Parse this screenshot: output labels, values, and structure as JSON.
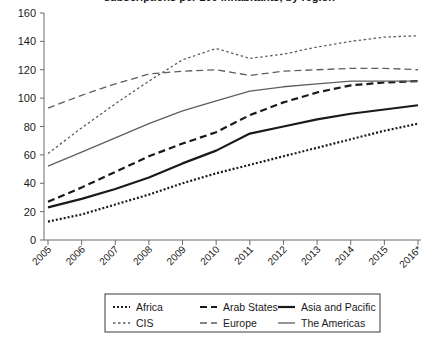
{
  "chart": {
    "title_partial": "subscriptions per 100 inhabitants, by region",
    "title_visible": false
  },
  "chart_data": {
    "type": "line",
    "title": "",
    "xlabel": "",
    "ylabel": "",
    "ylim": [
      0,
      160
    ],
    "ytick_values": [
      0,
      20,
      40,
      60,
      80,
      100,
      120,
      140,
      160
    ],
    "ytick_labels": [
      "0",
      "20",
      "40",
      "60",
      "80",
      "100",
      "120",
      "140",
      "160"
    ],
    "grid": false,
    "legend_position": "bottom",
    "legend_columns": 3,
    "x": [
      "2005",
      "2006",
      "2007",
      "2008",
      "2009",
      "2010",
      "2011",
      "2012",
      "2013",
      "2014",
      "2015",
      "2016*"
    ],
    "categories": [
      "2005",
      "2006",
      "2007",
      "2008",
      "2009",
      "2010",
      "2011",
      "2012",
      "2013",
      "2014",
      "2015",
      "2016*"
    ],
    "series": [
      {
        "name": "Africa",
        "style": "dotted",
        "color": "#1a1a1a",
        "width": 2.2,
        "dash": "2,2",
        "values": [
          13,
          18,
          25,
          32,
          40,
          47,
          53,
          59,
          65,
          71,
          77,
          82
        ]
      },
      {
        "name": "Arab States",
        "style": "dashed",
        "color": "#1a1a1a",
        "width": 2.2,
        "dash": "7,4",
        "values": [
          27,
          37,
          48,
          59,
          68,
          76,
          88,
          97,
          104,
          109,
          111,
          112
        ]
      },
      {
        "name": "Asia and Pacific",
        "style": "solid",
        "color": "#1a1a1a",
        "width": 2.2,
        "dash": "",
        "values": [
          23,
          29,
          36,
          44,
          54,
          63,
          75,
          80,
          85,
          89,
          92,
          95
        ]
      },
      {
        "name": "CIS",
        "style": "dotted",
        "color": "#5e5e5e",
        "width": 1.3,
        "dash": "2.5,2.5",
        "values": [
          61,
          79,
          96,
          112,
          127,
          135,
          128,
          131,
          136,
          140,
          143,
          144
        ]
      },
      {
        "name": "Europe",
        "style": "dashed",
        "color": "#5e5e5e",
        "width": 1.3,
        "dash": "7,4",
        "values": [
          93,
          102,
          110,
          117,
          119,
          120,
          116,
          119,
          120,
          121,
          121,
          120
        ]
      },
      {
        "name": "The Americas",
        "style": "solid",
        "color": "#5e5e5e",
        "width": 1.3,
        "dash": "",
        "values": [
          52,
          62,
          72,
          82,
          91,
          98,
          105,
          108,
          110,
          112,
          112,
          112
        ]
      }
    ],
    "legend": [
      {
        "label": "Africa",
        "style": "dotted",
        "color": "#1a1a1a",
        "width": 2.2,
        "dash": "2,2"
      },
      {
        "label": "Arab States",
        "style": "dashed",
        "color": "#1a1a1a",
        "width": 2.2,
        "dash": "7,4"
      },
      {
        "label": "Asia and Pacific",
        "style": "solid",
        "color": "#1a1a1a",
        "width": 2.2,
        "dash": ""
      },
      {
        "label": "CIS",
        "style": "dotted",
        "color": "#5e5e5e",
        "width": 1.3,
        "dash": "2.5,2.5"
      },
      {
        "label": "Europe",
        "style": "dashed",
        "color": "#5e5e5e",
        "width": 1.3,
        "dash": "7,4"
      },
      {
        "label": "The Americas",
        "style": "solid",
        "color": "#5e5e5e",
        "width": 1.3,
        "dash": ""
      }
    ],
    "colors": {
      "axis": "#6b6b6b",
      "text": "#1a1a1a",
      "dark_series": "#1a1a1a",
      "light_series": "#5e5e5e",
      "background": "#ffffff",
      "legend_border": "#3a3a3a"
    }
  }
}
